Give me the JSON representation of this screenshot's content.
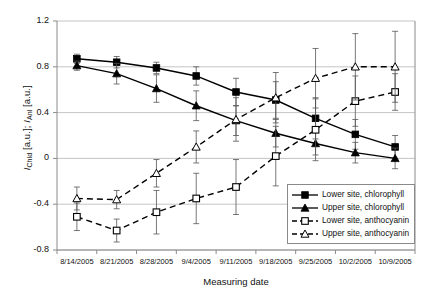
{
  "chart_data": {
    "type": "line",
    "title": "",
    "xlabel": "Measuring date",
    "ylabel": "I_Chld [a.u.]; I_Anl [a.u.]",
    "ylabel_parts": {
      "i1": "I",
      "sub1": "Chld",
      "unit1": " [a.u.]; ",
      "i2": "I",
      "sub2": "Anl",
      "unit2": " [a.u.]"
    },
    "categories": [
      "8/14/2005",
      "8/21/2005",
      "8/28/2005",
      "9/4/2005",
      "9/11/2005",
      "9/18/2005",
      "9/25/2005",
      "10/2/2005",
      "10/9/2005"
    ],
    "ylim": [
      -0.8,
      1.2
    ],
    "yticks": [
      1.2,
      0.8,
      0.4,
      0,
      -0.4,
      -0.8
    ],
    "ytick_labels": [
      "1.2",
      "0.8",
      "0.4",
      "0",
      "-0.4",
      "-0.8"
    ],
    "grid": true,
    "grid_axis": "y",
    "legend_position": "inside-lower-right",
    "series": [
      {
        "name": "Lower site, chlorophyll",
        "marker": "filled-square",
        "line": "solid",
        "color": "#000000",
        "values": [
          0.87,
          0.84,
          0.79,
          0.72,
          0.58,
          0.51,
          0.35,
          0.21,
          0.1
        ],
        "err_low": [
          0.04,
          0.05,
          0.05,
          0.08,
          0.12,
          0.16,
          0.18,
          0.13,
          0.1
        ],
        "err_high": [
          0.04,
          0.05,
          0.05,
          0.08,
          0.12,
          0.16,
          0.18,
          0.13,
          0.1
        ]
      },
      {
        "name": "Upper site, chlorophyll",
        "marker": "filled-triangle",
        "line": "solid",
        "color": "#000000",
        "values": [
          0.81,
          0.74,
          0.61,
          0.46,
          0.33,
          0.22,
          0.13,
          0.05,
          0.0
        ],
        "err_low": [
          0.04,
          0.09,
          0.12,
          0.13,
          0.13,
          0.12,
          0.1,
          0.09,
          0.09
        ],
        "err_high": [
          0.04,
          0.09,
          0.12,
          0.13,
          0.13,
          0.12,
          0.1,
          0.09,
          0.09
        ]
      },
      {
        "name": "Lower site, anthocyanin",
        "marker": "open-square",
        "line": "dashed",
        "color": "#000000",
        "values": [
          -0.51,
          -0.63,
          -0.47,
          -0.35,
          -0.25,
          0.02,
          0.25,
          0.5,
          0.58
        ],
        "err_low": [
          0.12,
          0.1,
          0.19,
          0.22,
          0.24,
          0.26,
          0.27,
          0.22,
          0.16
        ],
        "err_high": [
          0.12,
          0.1,
          0.19,
          0.22,
          0.24,
          0.26,
          0.27,
          0.22,
          0.16
        ]
      },
      {
        "name": "Upper site, anthocyanin",
        "marker": "open-triangle",
        "line": "dashed",
        "color": "#000000",
        "values": [
          -0.35,
          -0.36,
          -0.13,
          0.1,
          0.34,
          0.53,
          0.7,
          0.8,
          0.8
        ],
        "err_low": [
          0.1,
          0.08,
          0.12,
          0.14,
          0.19,
          0.22,
          0.26,
          0.29,
          0.31
        ],
        "err_high": [
          0.1,
          0.08,
          0.12,
          0.14,
          0.19,
          0.22,
          0.26,
          0.29,
          0.31
        ]
      }
    ]
  },
  "legend": {
    "items": [
      "Lower site, chlorophyll",
      "Upper site, chlorophyll",
      "Lower site, anthocyanin",
      "Upper site, anthocyanin"
    ]
  }
}
